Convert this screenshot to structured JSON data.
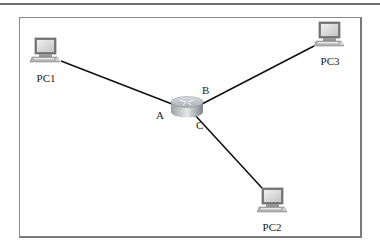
{
  "diagram": {
    "type": "network-topology",
    "router": {
      "name": "router",
      "ports": [
        "A",
        "B",
        "C"
      ]
    },
    "nodes": [
      {
        "id": "pc1",
        "label": "PC1",
        "connected_port": "A"
      },
      {
        "id": "pc3",
        "label": "PC3",
        "connected_port": "B"
      },
      {
        "id": "pc2",
        "label": "PC2",
        "connected_port": "C"
      }
    ],
    "port_labels": {
      "a": "A",
      "b": "B",
      "c": "C"
    },
    "colors": {
      "link": "#111111",
      "frame": "#8a8a8a",
      "pc_screen": "#d8d8d8",
      "pc_body": "#8c8c8c",
      "router_body": "#b9bec4"
    }
  }
}
